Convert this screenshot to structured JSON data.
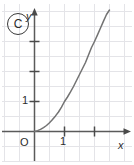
{
  "figure": {
    "panel_label": "C",
    "width": 134,
    "height": 165,
    "background_color": "#ffffff",
    "grid_color": "#e2e2e6",
    "axis_color": "#4a4a4a",
    "curve_color": "#6b6b6b",
    "text_color": "#2b2b2b"
  },
  "axes": {
    "x_label": "x",
    "y_label": "y",
    "origin_label": "O",
    "x_tick_labels": [
      "1"
    ],
    "y_tick_labels": [
      "1"
    ]
  },
  "chart_data": {
    "type": "line",
    "title": "",
    "subtitle": "",
    "xlabel": "x",
    "ylabel": "y",
    "origin_label": "O",
    "xlim": [
      -1.0,
      3.1
    ],
    "ylim": [
      -0.5,
      4.0
    ],
    "grid": true,
    "grid_step": 0.5,
    "legend": null,
    "annotations": [
      "C"
    ],
    "x_ticks": [
      1,
      2
    ],
    "x_tick_labels": [
      "1",
      ""
    ],
    "y_ticks": [
      1,
      2,
      3
    ],
    "y_tick_labels": [
      "1",
      "",
      ""
    ],
    "series": [
      {
        "name": "curve",
        "description": "increasing convex curve through the origin",
        "x": [
          0.0,
          0.1,
          0.2,
          0.3,
          0.4,
          0.5,
          0.6,
          0.7,
          0.8,
          0.9,
          1.0,
          1.1,
          1.2,
          1.3,
          1.4,
          1.5,
          1.6,
          1.7,
          1.8,
          1.9,
          2.0,
          2.1,
          2.2,
          2.3,
          2.4,
          2.5,
          2.6
        ],
        "y": [
          0.0,
          0.03,
          0.07,
          0.13,
          0.2,
          0.29,
          0.4,
          0.52,
          0.65,
          0.81,
          1.0,
          1.15,
          1.32,
          1.5,
          1.7,
          1.9,
          2.1,
          2.3,
          2.55,
          2.8,
          3.0,
          3.22,
          3.45,
          3.68,
          3.9,
          4.05,
          4.2
        ]
      }
    ]
  }
}
